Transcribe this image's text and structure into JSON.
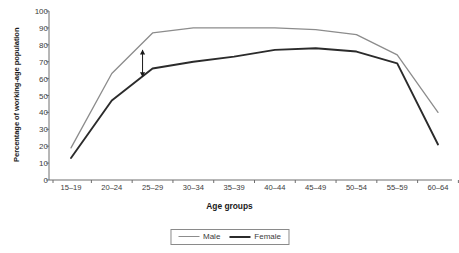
{
  "chart_data": {
    "type": "line",
    "title": "",
    "xlabel": "Age groups",
    "ylabel": "Percentage of working-age population",
    "categories": [
      "15–19",
      "20–24",
      "25–29",
      "30–34",
      "35–39",
      "40–44",
      "45–49",
      "50–54",
      "55–59",
      "60–64"
    ],
    "ylim": [
      0,
      100
    ],
    "yticks": [
      0,
      10,
      20,
      30,
      40,
      50,
      60,
      70,
      80,
      90,
      100
    ],
    "grid": false,
    "legend_position": "bottom-center",
    "series": [
      {
        "name": "Male",
        "color": "#8c8c8c",
        "values": [
          19,
          63,
          87,
          90,
          90,
          90,
          89,
          86,
          74,
          40
        ]
      },
      {
        "name": "Female",
        "color": "#2b2b2b",
        "values": [
          13,
          47,
          66,
          70,
          73,
          77,
          78,
          76,
          69,
          21
        ]
      }
    ],
    "annotations": [
      {
        "type": "double-arrow",
        "name": "gender-gap-arrow",
        "category": "25–29",
        "y_top": 77,
        "y_bottom": 61,
        "label": ""
      }
    ]
  },
  "axis": {
    "y_title": "Percentage of working-age population",
    "x_title": "Age groups"
  },
  "legend": {
    "items": [
      {
        "label": "Male"
      },
      {
        "label": "Female"
      }
    ]
  }
}
